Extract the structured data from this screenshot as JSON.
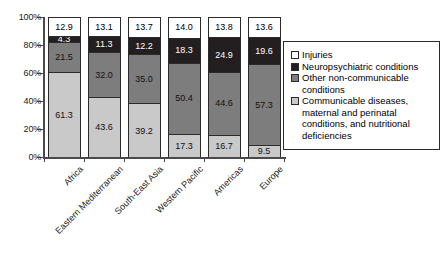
{
  "chart_data": {
    "type": "bar",
    "title": "",
    "subtitle": "",
    "xlabel": "",
    "ylabel": "",
    "stacked": true,
    "stack_total_percent": 100,
    "ylim": [
      0,
      100
    ],
    "grid": false,
    "legend_position": "right",
    "ytick_labels": [
      "0%",
      "20%",
      "40%",
      "60%",
      "80%",
      "100%"
    ],
    "ytick_values": [
      0,
      20,
      40,
      60,
      80,
      100
    ],
    "categories": [
      "Africa",
      "Eastern Mediterranean",
      "South-East Asia",
      "Western Pacific",
      "Americas",
      "Europe"
    ],
    "series": [
      {
        "name": "Injuries",
        "color": "#ffffff",
        "values": [
          12.9,
          13.1,
          13.7,
          14.0,
          13.8,
          13.6
        ]
      },
      {
        "name": "Neuropsychiatric conditions",
        "color": "#231f20",
        "values": [
          4.3,
          11.3,
          12.2,
          18.3,
          24.9,
          19.6
        ]
      },
      {
        "name": "Other non-communicable conditions",
        "color": "#7d7d7d",
        "values": [
          21.5,
          32.0,
          35.0,
          50.4,
          44.6,
          57.3
        ]
      },
      {
        "name": "Communicable diseases, maternal and perinatal conditions, and nutritional deficiencies",
        "color": "#c9c9c9",
        "values": [
          61.3,
          43.6,
          39.2,
          17.3,
          16.7,
          9.5
        ]
      }
    ]
  },
  "legend": {
    "items": [
      {
        "label": "Injuries"
      },
      {
        "label": "Neuropsychiatric conditions"
      },
      {
        "label": "Other non-communicable conditions"
      },
      {
        "label": "Communicable diseases, maternal and perinatal conditions, and nutritional deficiencies"
      }
    ]
  },
  "caption": ""
}
